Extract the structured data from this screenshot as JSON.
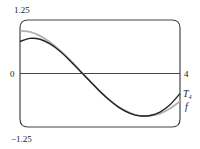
{
  "chart_data": {
    "type": "line",
    "title": "",
    "xlabel": "",
    "ylabel": "",
    "xlim": [
      0,
      4
    ],
    "ylim": [
      -1.25,
      1.25
    ],
    "grid": false,
    "frame": "rounded-box",
    "x_ticks": [
      {
        "value": 4,
        "label": "4"
      }
    ],
    "y_ticks": [
      {
        "value": 1.25,
        "label": "1.25"
      },
      {
        "value": 0,
        "label": "0"
      },
      {
        "value": -1.25,
        "label": "−1.25"
      }
    ],
    "legend_position": "right-inline",
    "series": [
      {
        "name": "T₄",
        "label_main": "T",
        "label_sub": "4",
        "color": "#222222",
        "description": "Degree-4 Taylor polynomial of cos x centered at x = 2",
        "x": [
          0,
          0.25,
          0.5,
          0.75,
          1,
          1.25,
          1.5,
          1.75,
          2,
          2.25,
          2.5,
          2.75,
          3,
          3.25,
          3.5,
          3.75,
          4
        ],
        "values": [
          0.75,
          0.82,
          0.8,
          0.69,
          0.52,
          0.3,
          0.06,
          -0.18,
          -0.42,
          -0.63,
          -0.81,
          -0.93,
          -0.99,
          -0.98,
          -0.9,
          -0.73,
          -0.47
        ]
      },
      {
        "name": "f",
        "label_main": "f",
        "color": "#b0b0b0",
        "description": "f(x) = cos x",
        "x": [
          0,
          0.25,
          0.5,
          0.75,
          1,
          1.25,
          1.5,
          1.75,
          2,
          2.25,
          2.5,
          2.75,
          3,
          3.25,
          3.5,
          3.75,
          4
        ],
        "values": [
          1.0,
          0.97,
          0.88,
          0.73,
          0.54,
          0.32,
          0.07,
          -0.18,
          -0.42,
          -0.63,
          -0.8,
          -0.92,
          -0.99,
          -0.99,
          -0.94,
          -0.82,
          -0.65
        ]
      }
    ]
  }
}
